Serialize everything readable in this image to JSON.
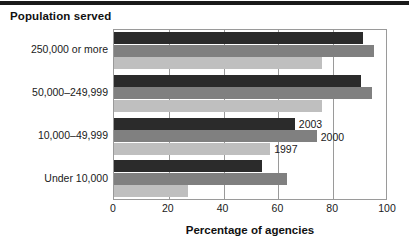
{
  "figure": {
    "title": "Population served",
    "xaxis_title": "Percentage of agencies"
  },
  "chart_data": {
    "type": "bar",
    "orientation": "horizontal",
    "title": "Population served",
    "xlabel": "Percentage of agencies",
    "ylabel": "Population served",
    "xlim": [
      0,
      100
    ],
    "xticks": [
      "0",
      "20",
      "40",
      "60",
      "80",
      "100"
    ],
    "grid": true,
    "legend": "inline-annotations",
    "categories": [
      "250,000 or more",
      "50,000–249,999",
      "10,000–49,999",
      "Under 10,000"
    ],
    "series": [
      {
        "name": "2003",
        "color": "#2b2b2b",
        "values": [
          91,
          90,
          66,
          54
        ]
      },
      {
        "name": "2000",
        "color": "#808080",
        "values": [
          95,
          94,
          74,
          63
        ]
      },
      {
        "name": "1997",
        "color": "#bfbfbf",
        "values": [
          76,
          76,
          57,
          27
        ]
      }
    ],
    "annotations": [
      {
        "label": "2003",
        "series": "2003",
        "category": "10,000–49,999"
      },
      {
        "label": "2000",
        "series": "2000",
        "category": "10,000–49,999"
      },
      {
        "label": "1997",
        "series": "1997",
        "category": "10,000–49,999"
      }
    ]
  },
  "colors": {
    "series_2003": "#2b2b2b",
    "series_2000": "#808080",
    "series_1997": "#bfbfbf",
    "frame": "#9a9a9a",
    "text": "#1a1a1a",
    "rule": "#1a1a1a"
  }
}
